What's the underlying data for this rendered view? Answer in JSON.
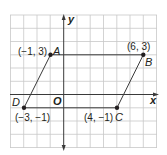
{
  "figure": {
    "type": "coordinate-plane-parallelogram",
    "axes": {
      "x_label": "x",
      "y_label": "y",
      "origin_label": "O"
    },
    "points": [
      {
        "name": "A",
        "coord_label": "(−1, 3)",
        "x": -1,
        "y": 3
      },
      {
        "name": "B",
        "coord_label": "(6, 3)",
        "x": 6,
        "y": 3
      },
      {
        "name": "C",
        "coord_label": "(4, −1)",
        "x": 4,
        "y": -1
      },
      {
        "name": "D",
        "coord_label": "(−3, −1)",
        "x": -3,
        "y": -1
      }
    ],
    "colors": {
      "grid": "#c8c8c8",
      "lines": "#3a3a3a",
      "text": "#231f20"
    }
  }
}
